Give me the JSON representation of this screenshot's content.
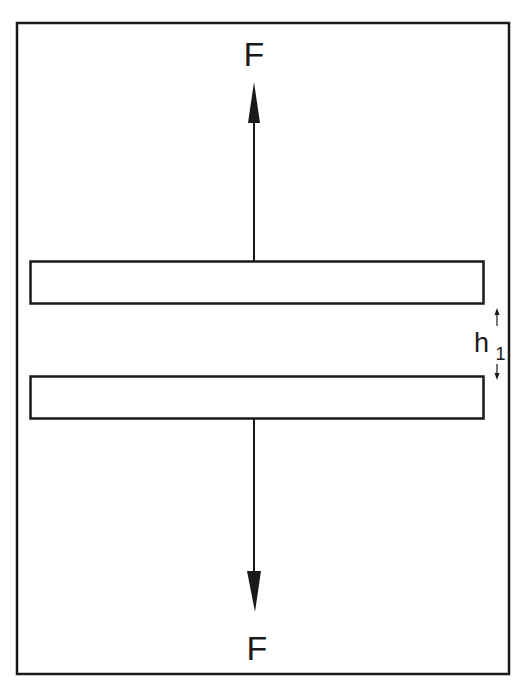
{
  "diagram": {
    "frame": {
      "x": 16,
      "y": 22,
      "width": 494,
      "height": 653
    },
    "colors": {
      "stroke": "#1a1a1a",
      "background": "#ffffff"
    },
    "plates": [
      {
        "name": "top-plate",
        "x": 30,
        "y": 261,
        "width": 454,
        "height": 43
      },
      {
        "name": "bottom-plate",
        "x": 30,
        "y": 376,
        "width": 454,
        "height": 43
      }
    ],
    "forces": {
      "top": {
        "label": "F",
        "direction": "up"
      },
      "bottom": {
        "label": "F",
        "direction": "down"
      }
    },
    "gap": {
      "label": "h",
      "subscript": "1"
    }
  }
}
